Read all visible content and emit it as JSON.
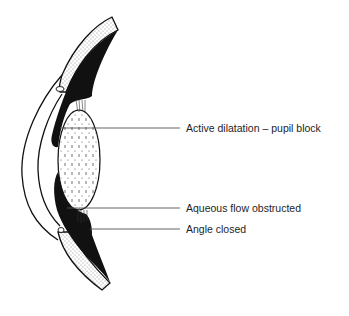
{
  "diagram": {
    "labels": [
      {
        "id": "active-dilatation",
        "text": "Active dilatation – pupil block"
      },
      {
        "id": "aqueous-flow",
        "text": "Aqueous flow obstructed"
      },
      {
        "id": "angle-closed",
        "text": "Angle closed"
      }
    ],
    "colors": {
      "ink": "#111111",
      "leader": "#555555",
      "background": "#ffffff"
    }
  }
}
